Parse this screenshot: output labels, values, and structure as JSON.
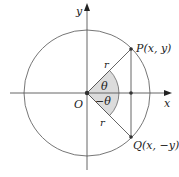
{
  "diagram": {
    "axes": {
      "x_label": "x",
      "y_label": "y"
    },
    "origin_label": "O",
    "point_p": {
      "label": "P(x, y)"
    },
    "point_q": {
      "label": "Q(x, −y)"
    },
    "radius_label_upper": "r",
    "radius_label_lower": "r",
    "angle_upper": "θ",
    "angle_lower": "−θ",
    "colors": {
      "line": "#555555",
      "shade": "#d9d9d9",
      "point": "#333333"
    }
  }
}
